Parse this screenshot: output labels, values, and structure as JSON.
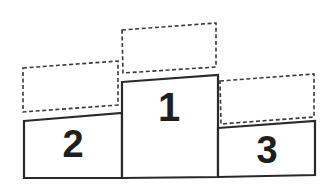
{
  "diagram": {
    "title": "",
    "colors": {
      "background": "#ffffff",
      "stroke": "#2a2a2a",
      "dashed_stroke": "#3a3a3a",
      "label": "#1e1e1e"
    },
    "podiums": [
      {
        "rank": "2",
        "label": "2",
        "position": "left",
        "points": "24,121 122,113 122,178 24,178",
        "label_x": 73,
        "label_y": 157,
        "label_size": 38,
        "placeholder": "23,68 118,61 118,105 23,112"
      },
      {
        "rank": "1",
        "label": "1",
        "position": "center",
        "points": "122,82 218,75 218,177 122,178",
        "label_x": 169,
        "label_y": 121,
        "label_size": 40,
        "placeholder": "122,30 216,23 216,67 123,73"
      },
      {
        "rank": "3",
        "label": "3",
        "position": "right",
        "points": "218,128 315,121 315,175 218,177",
        "label_x": 267,
        "label_y": 163,
        "label_size": 38,
        "placeholder": "220,81 314,74 314,117 221,124"
      }
    ]
  }
}
